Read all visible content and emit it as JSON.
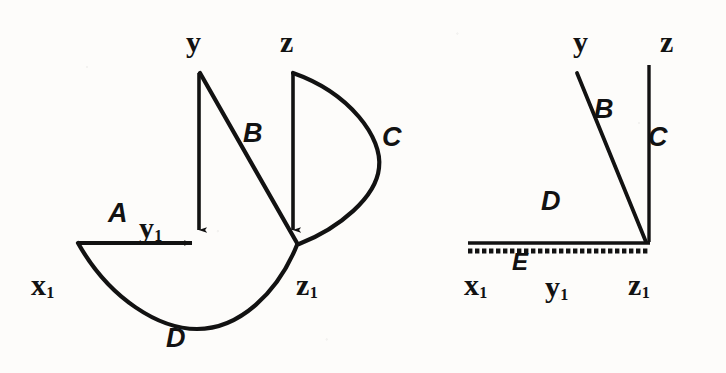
{
  "figure": {
    "background_color": "#fdfcfa",
    "ink_color": "#121212",
    "panels": [
      {
        "id": "left-panel",
        "name": "unconstrained-mechanism-diagram",
        "nodes": [
          {
            "id": "y",
            "label": "y",
            "sub": "",
            "x": 196,
            "y": 42
          },
          {
            "id": "z",
            "label": "z",
            "sub": "",
            "x": 290,
            "y": 42
          },
          {
            "id": "x1",
            "label": "x",
            "sub": "1",
            "x": 46,
            "y": 295
          },
          {
            "id": "y1",
            "label": "y",
            "sub": "1",
            "x": 152,
            "y": 238
          },
          {
            "id": "z1",
            "label": "z",
            "sub": "1",
            "x": 309,
            "y": 295
          }
        ],
        "edges": [
          {
            "id": "A",
            "label": "A",
            "x": 118,
            "y": 220,
            "kind": "straight-horizontal-arrow"
          },
          {
            "id": "B",
            "label": "B",
            "x": 253,
            "y": 139,
            "kind": "straight-diagonal"
          },
          {
            "id": "C",
            "label": "C",
            "x": 392,
            "y": 144,
            "kind": "curved-arc"
          },
          {
            "id": "D",
            "label": "D",
            "x": 176,
            "y": 345,
            "kind": "curved-sag"
          }
        ]
      },
      {
        "id": "right-panel",
        "name": "grounded-mechanism-diagram",
        "nodes": [
          {
            "id": "y",
            "label": "y",
            "sub": "",
            "x": 584,
            "y": 42
          },
          {
            "id": "z",
            "label": "z",
            "sub": "",
            "x": 670,
            "y": 42
          },
          {
            "id": "x1",
            "label": "x",
            "sub": "1",
            "x": 478,
            "y": 295
          },
          {
            "id": "y1",
            "label": "y",
            "sub": "1",
            "x": 558,
            "y": 295
          },
          {
            "id": "z1",
            "label": "z",
            "sub": "1",
            "x": 641,
            "y": 295
          }
        ],
        "edges": [
          {
            "id": "B",
            "label": "B",
            "x": 603,
            "y": 114,
            "kind": "straight-diagonal"
          },
          {
            "id": "C",
            "label": "C",
            "x": 657,
            "y": 143,
            "kind": "straight-vertical"
          },
          {
            "id": "D",
            "label": "D",
            "x": 552,
            "y": 207,
            "kind": "straight-horizontal"
          },
          {
            "id": "E",
            "label": "E",
            "x": 521,
            "y": 267,
            "kind": "ground-hatching"
          }
        ]
      }
    ]
  }
}
